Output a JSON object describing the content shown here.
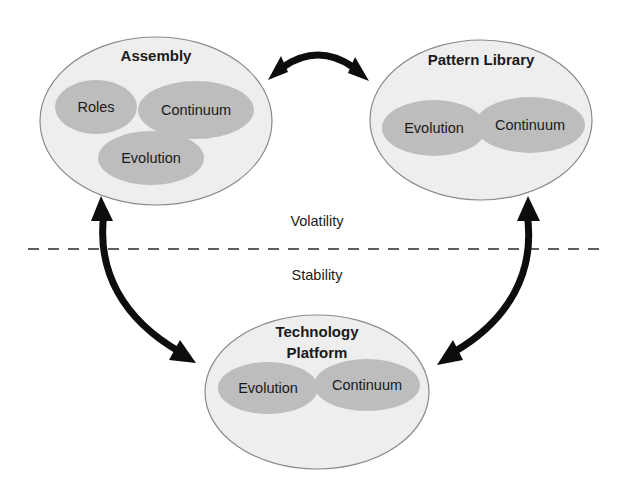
{
  "diagram": {
    "background_color": "#ffffff",
    "outer_fill": "#eeeeee",
    "outer_stroke": "#8a8a8a",
    "inner_fill": "#bdbdbd",
    "line_color": "#0d0d0d",
    "text_color": "#1a1a1a"
  },
  "groups": [
    {
      "id": "assembly",
      "title": "Assembly",
      "zone": "Volatility",
      "items": [
        {
          "label": "Roles"
        },
        {
          "label": "Continuum"
        },
        {
          "label": "Evolution"
        }
      ]
    },
    {
      "id": "pattern-library",
      "title": "Pattern Library",
      "zone": "Volatility",
      "items": [
        {
          "label": "Evolution"
        },
        {
          "label": "Continuum"
        }
      ]
    },
    {
      "id": "technology-platform",
      "title_line1": "Technology",
      "title_line2": "Platform",
      "zone": "Stability",
      "items": [
        {
          "label": "Evolution"
        },
        {
          "label": "Continuum"
        }
      ]
    }
  ],
  "zones": {
    "upper_label": "Volatility",
    "lower_label": "Stability"
  },
  "connectors": [
    {
      "id": "assembly-pattern-library",
      "from": "assembly",
      "to": "pattern-library",
      "bidirectional": true
    },
    {
      "id": "assembly-technology-platform",
      "from": "assembly",
      "to": "technology-platform",
      "bidirectional": true
    },
    {
      "id": "pattern-library-technology-platform",
      "from": "pattern-library",
      "to": "technology-platform",
      "bidirectional": true
    }
  ]
}
